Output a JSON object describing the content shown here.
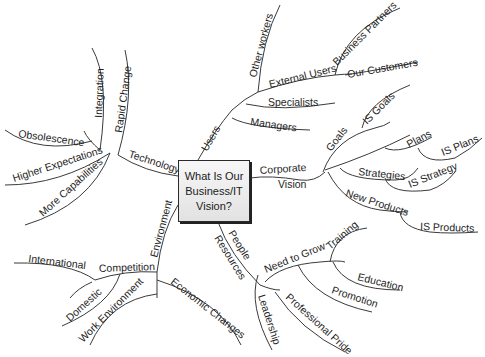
{
  "center": {
    "line1": "What Is Our",
    "line2": "Business/IT",
    "line3": "Vision?"
  },
  "branches": {
    "users": {
      "label": "Users",
      "children": {
        "other_workers": "Other workers",
        "external_users": "External Users",
        "business_partners": "Business Partners",
        "our_customers": "Our Customers",
        "specialists": "Specialists",
        "managers": "Managers"
      }
    },
    "corporate_vision": {
      "label_line1": "Corporate",
      "label_line2": "Vision",
      "children": {
        "goals": "Goals",
        "is_goals": "IS Goals",
        "plans": "Plans",
        "is_plans": "IS Plans",
        "strategies": "Strategies",
        "is_strategy": "IS Strategy",
        "new_products": "New Products",
        "is_products": "IS Products"
      }
    },
    "people_resources": {
      "label_line1": "People",
      "label_line2": "Resources",
      "children": {
        "need_to_grow": "Need to Grow",
        "training": "Training",
        "education": "Education",
        "promotion": "Promotion",
        "professional_pride": "Professional Pride",
        "leadership": "Leadership"
      }
    },
    "environment": {
      "label": "Environment",
      "children": {
        "competition": "Competition",
        "international": "International",
        "domestic": "Domestic",
        "work_environment": "Work Environment",
        "economic_changes": "Economic Changes"
      }
    },
    "technology": {
      "label": "Technology",
      "children": {
        "integration": "Integration",
        "rapid_change": "Rapid Change",
        "obsolescence": "Obsolescence",
        "higher_expectations": "Higher Expectations",
        "more_capabilities": "More Capabilities"
      }
    }
  },
  "colors": {
    "line": "#3a3a3a",
    "text": "#1e1e1e",
    "box_border": "#2a2a2a"
  }
}
